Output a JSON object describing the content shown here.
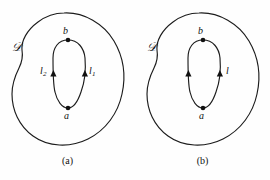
{
  "figure": {
    "background_color": "#fefefe",
    "stroke_color": "#1c1c1c",
    "panels": [
      {
        "id": "a",
        "caption": "(a)",
        "domain_label": "𝒟",
        "point_labels": {
          "top": "b",
          "bottom": "a"
        },
        "arc_labels": {
          "left": "l",
          "left_sub": "2",
          "right": "l",
          "right_sub": "1"
        },
        "arrow_count": 2
      },
      {
        "id": "b",
        "caption": "(b)",
        "domain_label": "𝒟",
        "point_labels": {
          "top": "b",
          "bottom": "a"
        },
        "arc_labels": {
          "left": "",
          "left_sub": "",
          "right": "l",
          "right_sub": ""
        },
        "arrow_count": 2
      }
    ]
  },
  "panel_a": {
    "caption": "(a)",
    "domain": "𝒟",
    "point_top": "b",
    "point_bottom": "a",
    "arc_left": "l",
    "arc_left_sub": "2",
    "arc_right": "l",
    "arc_right_sub": "1"
  },
  "panel_b": {
    "caption": "(b)",
    "domain": "𝒟",
    "point_top": "b",
    "point_bottom": "a",
    "arc_right": "l"
  }
}
